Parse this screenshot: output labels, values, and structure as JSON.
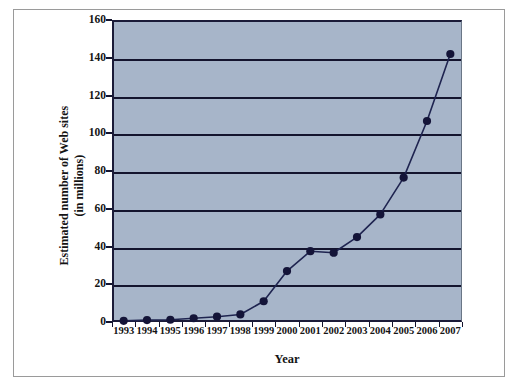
{
  "figure": {
    "background_color": "#ffffff",
    "frame_color": "#9a9a9a"
  },
  "chart_data": {
    "type": "line",
    "title": "",
    "xlabel": "Year",
    "ylabel": "Estimated number of Web sites (in millions)",
    "ylabel_line1": "Estimated number of Web sites",
    "ylabel_line2": "(in millions)",
    "categories": [
      "1993",
      "1994",
      "1995",
      "1996",
      "1997",
      "1998",
      "1999",
      "2000",
      "2001",
      "2002",
      "2003",
      "2004",
      "2005",
      "2006",
      "2007"
    ],
    "x": [
      1993,
      1994,
      1995,
      1996,
      1997,
      1998,
      1999,
      2000,
      2001,
      2002,
      2003,
      2004,
      2005,
      2006,
      2007
    ],
    "values": [
      0.6,
      1.0,
      1.2,
      2.0,
      2.8,
      4.0,
      11.0,
      27.0,
      37.5,
      36.7,
      45.0,
      57.0,
      76.5,
      106.5,
      142.0
    ],
    "series": [
      {
        "name": "Estimated number of Web sites (in millions)",
        "values": [
          0.6,
          1.0,
          1.2,
          2.0,
          2.8,
          4.0,
          11.0,
          27.0,
          37.5,
          36.7,
          45.0,
          57.0,
          76.5,
          106.5,
          142.0
        ]
      }
    ],
    "ylim": [
      0,
      160
    ],
    "yticks": [
      0,
      20,
      40,
      60,
      80,
      100,
      120,
      140,
      160
    ],
    "ytick_labels": [
      "0",
      "20",
      "40",
      "60",
      "80",
      "100",
      "120",
      "140",
      "160"
    ],
    "grid": true,
    "grid_axis": "y",
    "legend": false,
    "legend_position": "none",
    "plot_background_color": "#a7b5c9",
    "line_color": "#1f2450",
    "marker_color": "#141438",
    "marker_shape": "circle",
    "gridline_color": "#14142e",
    "axis_color": "#14142e"
  }
}
